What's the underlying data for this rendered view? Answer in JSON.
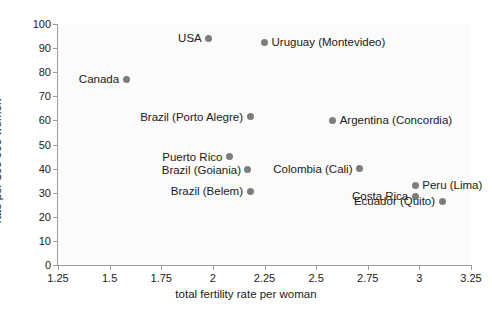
{
  "chart_data": {
    "type": "scatter",
    "title": "",
    "xlabel": "total fertility rate per woman",
    "ylabel": "rate per 100 000 women",
    "xlim": [
      1.25,
      3.25
    ],
    "ylim": [
      0,
      100
    ],
    "xticks": [
      "1.25",
      "1.5",
      "1.75",
      "2",
      "2.25",
      "2.5",
      "2.75",
      "3",
      "3.25"
    ],
    "xtick_values": [
      1.25,
      1.5,
      1.75,
      2,
      2.25,
      2.5,
      2.75,
      3,
      3.25
    ],
    "yticks": [
      "0",
      "10",
      "20",
      "30",
      "40",
      "50",
      "60",
      "70",
      "80",
      "90",
      "100"
    ],
    "ytick_values": [
      0,
      10,
      20,
      30,
      40,
      50,
      60,
      70,
      80,
      90,
      100
    ],
    "grid": false,
    "legend": "none",
    "marker_color": "#7d7d7d",
    "points": [
      {
        "label": "USA",
        "x": 1.98,
        "y": 94.0,
        "label_side": "left"
      },
      {
        "label": "Uruguay (Montevideo)",
        "x": 2.25,
        "y": 92.5,
        "label_side": "right"
      },
      {
        "label": "Canada",
        "x": 1.58,
        "y": 77.0,
        "label_side": "left"
      },
      {
        "label": "Brazil (Porto Alegre)",
        "x": 2.18,
        "y": 61.5,
        "label_side": "left"
      },
      {
        "label": "Argentina (Concordia)",
        "x": 2.58,
        "y": 60.0,
        "label_side": "right"
      },
      {
        "label": "Puerto Rico",
        "x": 2.08,
        "y": 45.0,
        "label_side": "left"
      },
      {
        "label": "Colombia (Cali)",
        "x": 2.71,
        "y": 40.0,
        "label_side": "left"
      },
      {
        "label": "Brazil (Goiania)",
        "x": 2.17,
        "y": 39.5,
        "label_side": "left"
      },
      {
        "label": "Peru (Lima)",
        "x": 2.98,
        "y": 33.0,
        "label_side": "right"
      },
      {
        "label": "Brazil (Belem)",
        "x": 2.18,
        "y": 30.5,
        "label_side": "left"
      },
      {
        "label": "Costa Rica",
        "x": 2.98,
        "y": 28.5,
        "label_side": "left"
      },
      {
        "label": "Ecuador (Quito)",
        "x": 3.11,
        "y": 26.5,
        "label_side": "left"
      }
    ]
  }
}
